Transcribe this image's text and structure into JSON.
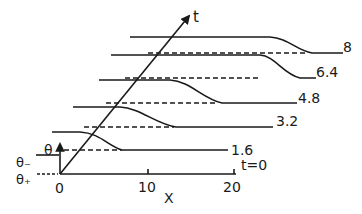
{
  "diagram": {
    "type": "waterfall-profile-plot",
    "axes": {
      "x_label": "X",
      "t_label": "t",
      "theta_label": "θ",
      "theta_minus_label": "θ₋",
      "theta_plus_label": "θ₊",
      "origin_label": "0",
      "x_ticks": [
        "10",
        "20"
      ]
    },
    "profiles": [
      {
        "t_label": "t=0"
      },
      {
        "t_label": "1.6"
      },
      {
        "t_label": "3.2"
      },
      {
        "t_label": "4.8"
      },
      {
        "t_label": "6.4"
      },
      {
        "t_label": "8"
      }
    ],
    "colors": {
      "ink": "#1a1a1a",
      "background": "#ffffff"
    }
  }
}
